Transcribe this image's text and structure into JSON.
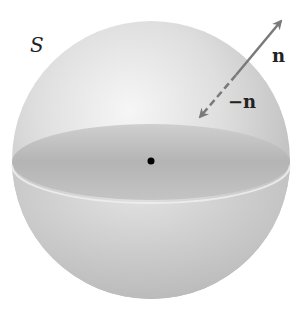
{
  "diagram": {
    "surface_label": "S",
    "normal_label": "n",
    "negative_normal_label": "−n",
    "elements": [
      "sphere",
      "equatorial-disc",
      "center-point",
      "outward-normal-arrow",
      "inward-normal-arrow"
    ],
    "colors": {
      "sphere_light": "#e8e8e8",
      "sphere_mid": "#c8c8c8",
      "disc": "#b8b8b8",
      "arrow": "#7a7a7a",
      "center_point": "#000000"
    }
  }
}
